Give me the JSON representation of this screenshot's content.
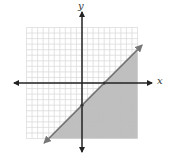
{
  "chart_data": {
    "type": "inequality-graph",
    "title": "",
    "xlabel": "x",
    "ylabel": "y",
    "xlim": [
      -10,
      10
    ],
    "ylim": [
      -10,
      10
    ],
    "grid": true,
    "grid_step": 1,
    "boundary_line": {
      "equation": "y = x - 4",
      "slope": 1,
      "intercept": -4,
      "style": "solid",
      "marked_points": [
        [
          0,
          -4
        ],
        [
          4,
          0
        ]
      ]
    },
    "inequality": "y <= x - 4",
    "shaded_region": "below-right of line",
    "colors": {
      "grid": "#d8d8d8",
      "axis": "#222222",
      "line": "#777777",
      "shade": "#a9a9a9"
    }
  },
  "labels": {
    "x_axis": "x",
    "y_axis": "y"
  }
}
